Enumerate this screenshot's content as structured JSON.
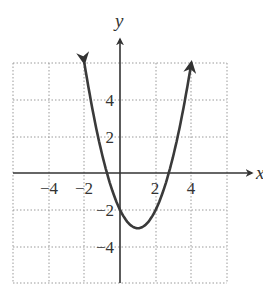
{
  "chart_data": {
    "type": "line",
    "title": "",
    "xlabel": "x",
    "ylabel": "y",
    "xlim": [
      -6,
      6
    ],
    "ylim": [
      -6,
      6
    ],
    "grid": true,
    "grid_style": "dotted",
    "x_ticks": [
      -4,
      -2,
      2,
      4
    ],
    "y_ticks": [
      4,
      2,
      -2,
      -4
    ],
    "x_tick_labels": [
      "−4",
      "−2",
      "2",
      "4"
    ],
    "y_tick_labels": [
      "4",
      "2",
      "−2",
      "−4"
    ],
    "series": [
      {
        "name": "parabola",
        "equation": "y = (x - 1)^2 - 3",
        "domain": [
          -2,
          4
        ],
        "arrows_at_ends": true,
        "vertex": [
          1,
          -3
        ],
        "y_intercept": -2,
        "x_intercepts": [
          -0.73,
          2.73
        ],
        "points": [
          [
            -2,
            6
          ],
          [
            -1,
            1
          ],
          [
            0,
            -2
          ],
          [
            1,
            -3
          ],
          [
            2,
            -2
          ],
          [
            3,
            1
          ],
          [
            4,
            6
          ]
        ]
      }
    ],
    "colors": {
      "curve": "#3a3a3a",
      "axis": "#333333",
      "grid": "#9a9a9a"
    }
  },
  "labels": {
    "x_axis": "x",
    "y_axis": "y",
    "ticks_x": [
      "−4",
      "−2",
      "2",
      "4"
    ],
    "ticks_y": [
      "4",
      "2",
      "−2",
      "−4"
    ]
  }
}
